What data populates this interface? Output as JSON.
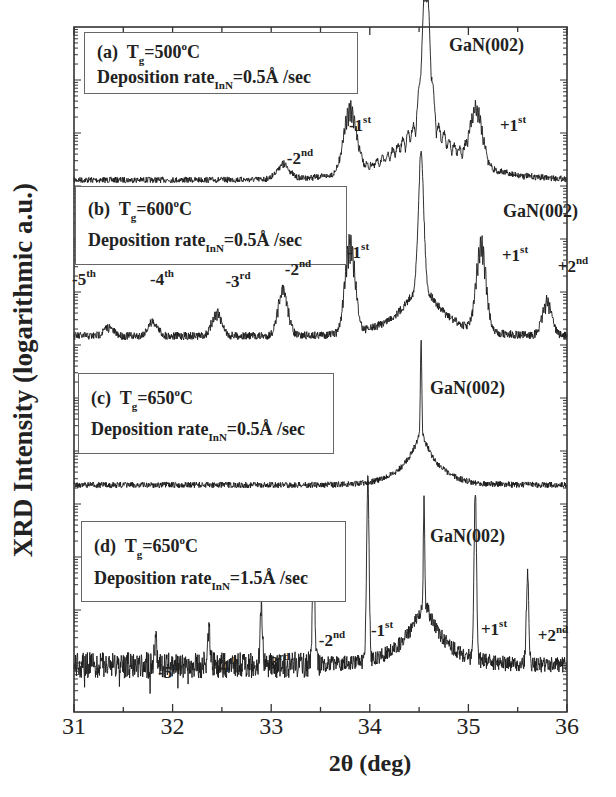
{
  "chart_data": {
    "type": "line",
    "title": "",
    "xlabel": "2θ (deg)",
    "ylabel": "XRD Intensity (logarithmic a.u.)",
    "xlim": [
      31,
      36
    ],
    "x_ticks": [
      "31",
      "32",
      "33",
      "34",
      "35",
      "36"
    ],
    "y_scale": "log (stacked, offset, no tick labels)",
    "grid": false,
    "legend_position": "inline boxes per panel (upper left)",
    "series": [
      {
        "name": "(a) Tg=500°C, Deposition rate InN=0.5Å/sec",
        "panel": "a",
        "main_peak": {
          "label": "GaN(002)",
          "x": 34.57
        },
        "satellite_peaks": [
          {
            "label": "-2nd",
            "x": 33.12,
            "rel_height": 0.08
          },
          {
            "label": "-1st",
            "x": 33.8,
            "rel_height": 0.35
          },
          {
            "label": "+1st",
            "x": 35.08,
            "rel_height": 0.3
          }
        ],
        "notes": "broad fringed main peak; thickness fringes visible"
      },
      {
        "name": "(b) Tg=600°C, Deposition rate InN=0.5Å/sec",
        "panel": "b",
        "main_peak": {
          "label": "GaN(002)",
          "x": 34.52
        },
        "satellite_peaks": [
          {
            "label": "-5th",
            "x": 31.35,
            "rel_height": 0.03
          },
          {
            "label": "-4th",
            "x": 31.8,
            "rel_height": 0.05
          },
          {
            "label": "-3rd",
            "x": 32.45,
            "rel_height": 0.08
          },
          {
            "label": "-2nd",
            "x": 33.12,
            "rel_height": 0.16
          },
          {
            "label": "-1st",
            "x": 33.8,
            "rel_height": 0.32
          },
          {
            "label": "+1st",
            "x": 35.13,
            "rel_height": 0.3
          },
          {
            "label": "+2nd",
            "x": 35.8,
            "rel_height": 0.12
          }
        ]
      },
      {
        "name": "(c) Tg=650°C, Deposition rate InN=0.5Å/sec",
        "panel": "c",
        "main_peak": {
          "label": "GaN(002)",
          "x": 34.52
        },
        "satellite_peaks": []
      },
      {
        "name": "(d) Tg=650°C, Deposition rate InN=1.5Å/sec",
        "panel": "d",
        "main_peak": {
          "label": "GaN(002)",
          "x": 34.55
        },
        "satellite_peaks": [
          {
            "label": "-5th",
            "x": 31.83,
            "rel_height": 0.06
          },
          {
            "label": "-4th",
            "x": 32.37,
            "rel_height": 0.08
          },
          {
            "label": "-3rd",
            "x": 32.9,
            "rel_height": 0.14
          },
          {
            "label": "-2nd",
            "x": 33.43,
            "rel_height": 0.25
          },
          {
            "label": "-1st",
            "x": 33.98,
            "rel_height": 0.45
          },
          {
            "label": "+1st",
            "x": 35.07,
            "rel_height": 0.42
          },
          {
            "label": "+2nd",
            "x": 35.6,
            "rel_height": 0.22
          }
        ]
      }
    ]
  },
  "panels": {
    "a": {
      "tag": "(a)",
      "tg_pre": "T",
      "tg_sub": "g",
      "tg_val": "=500",
      "tg_deg": "o",
      "tg_unit": "C",
      "rate_pre": "Deposition rate",
      "rate_sub": "InN",
      "rate_val": "=0.5Å  /sec",
      "gan": "GaN(002)"
    },
    "b": {
      "tag": "(b)",
      "tg_pre": "T",
      "tg_sub": "g",
      "tg_val": "=600",
      "tg_deg": "o",
      "tg_unit": "C",
      "rate_pre": "Deposition rate",
      "rate_sub": "InN",
      "rate_val": "=0.5Å  /sec",
      "gan": "GaN(002)"
    },
    "c": {
      "tag": "(c)",
      "tg_pre": "T",
      "tg_sub": "g",
      "tg_val": "=650",
      "tg_deg": "o",
      "tg_unit": "C",
      "rate_pre": "Deposition rate",
      "rate_sub": "InN",
      "rate_val": "=0.5Å  /sec",
      "gan": "GaN(002)"
    },
    "d": {
      "tag": "(d)",
      "tg_pre": "T",
      "tg_sub": "g",
      "tg_val": "=650",
      "tg_deg": "o",
      "tg_unit": "C",
      "rate_pre": "Deposition rate",
      "rate_sub": "InN",
      "rate_val": "=1.5Å  /sec",
      "gan": "GaN(002)"
    }
  },
  "orders": {
    "a": [
      {
        "n": "-2",
        "s": "nd"
      },
      {
        "n": "-1",
        "s": "st"
      },
      {
        "n": "+1",
        "s": "st"
      }
    ],
    "b": [
      {
        "n": "-5",
        "s": "th"
      },
      {
        "n": "-4",
        "s": "th"
      },
      {
        "n": "-3",
        "s": "rd"
      },
      {
        "n": "-2",
        "s": "nd"
      },
      {
        "n": "-1",
        "s": "st"
      },
      {
        "n": "+1",
        "s": "st"
      },
      {
        "n": "+2",
        "s": "nd"
      }
    ],
    "d": [
      {
        "n": "-5",
        "s": "th"
      },
      {
        "n": "-4",
        "s": "th"
      },
      {
        "n": "-3",
        "s": "rd"
      },
      {
        "n": "-2",
        "s": "nd"
      },
      {
        "n": "-1",
        "s": "st"
      },
      {
        "n": "+1",
        "s": "st"
      },
      {
        "n": "+2",
        "s": "nd"
      }
    ]
  },
  "axes": {
    "xlabel": "2θ (deg)",
    "ylabel": "XRD Intensity (logarithmic a.u.)",
    "xticks": [
      "31",
      "32",
      "33",
      "34",
      "35",
      "36"
    ]
  },
  "colors": {
    "line": "#1a1a1a",
    "frame": "#333333",
    "text": "#222222"
  }
}
